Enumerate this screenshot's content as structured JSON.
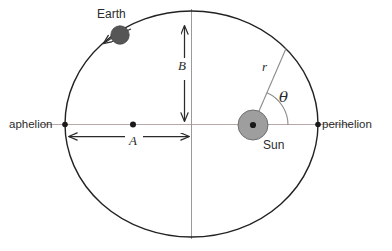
{
  "diagram": {
    "labels": {
      "earth": "Earth",
      "sun": "Sun",
      "aphelion": "aphelion",
      "perihelion": "perihelion",
      "semi_major": "A",
      "semi_minor": "B",
      "radius": "r",
      "angle": "θ"
    },
    "colors": {
      "orbit_stroke": "#222222",
      "axis_line": "#b9a8a8",
      "center_line": "#9a9a9a",
      "sun_fill": "#9e9e9e",
      "sun_stroke": "#6f6f6f",
      "earth_fill": "#565656",
      "marker_dot": "#1a1a1a",
      "arrow": "#2b2b2b",
      "background": "#ffffff"
    },
    "geometry": {
      "ellipse_center_x": 191.5,
      "ellipse_center_y": 124,
      "semi_major_px": 126.5,
      "semi_minor_px": 113,
      "sun_center_x": 253,
      "sun_center_y": 125,
      "sun_radius_px": 15,
      "earth_center_x": 120,
      "earth_center_y": 35,
      "earth_radius_px": 9,
      "theta_arc_radius_px": 35,
      "r_endpoint_x": 286,
      "r_endpoint_y": 49
    }
  }
}
